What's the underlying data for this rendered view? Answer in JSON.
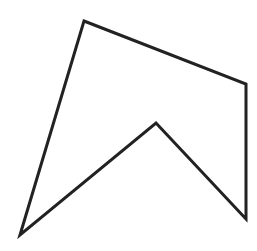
{
  "diagram": {
    "type": "polygon",
    "stroke_color": "#222222",
    "fill_color": "none",
    "stroke_width": 3,
    "vertices": [
      [
        84,
        21
      ],
      [
        246,
        84
      ],
      [
        246,
        219
      ],
      [
        156,
        123
      ],
      [
        20,
        235
      ]
    ]
  }
}
